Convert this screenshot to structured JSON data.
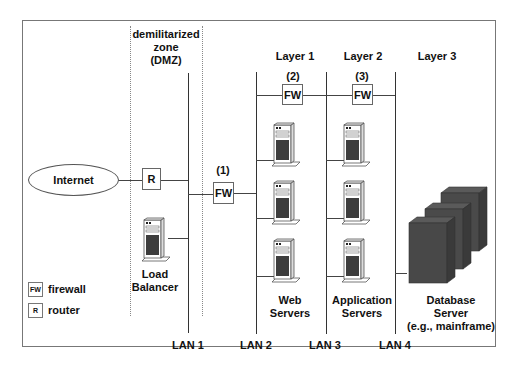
{
  "diagram": {
    "dmz_label": [
      "demilitarized",
      "zone",
      "(DMZ)"
    ],
    "layers": [
      {
        "label": "Layer 1",
        "firewall_number": "(2)"
      },
      {
        "label": "Layer 2",
        "firewall_number": "(3)"
      },
      {
        "label": "Layer 3"
      }
    ],
    "internet_label": "Internet",
    "router_label": "R",
    "firewalls": [
      {
        "number": "(1)",
        "label": "FW"
      },
      {
        "number": "(2)",
        "label": "FW"
      },
      {
        "number": "(3)",
        "label": "FW"
      }
    ],
    "load_balancer_label": [
      "Load",
      "Balancer"
    ],
    "web_servers_label": [
      "Web",
      "Servers"
    ],
    "app_servers_label": [
      "Application",
      "Servers"
    ],
    "database_label": [
      "Database",
      "Server",
      "(e.g., mainframe)"
    ],
    "lans": [
      "LAN 1",
      "LAN 2",
      "LAN 3",
      "LAN 4"
    ],
    "legend": [
      {
        "symbol": "FW",
        "text": "firewall"
      },
      {
        "symbol": "R",
        "text": "router"
      }
    ],
    "colors": {
      "line": "#333333",
      "server_dark": "#3d3d3d",
      "mainframe": "#4a4a4a",
      "border": "#777777"
    }
  }
}
